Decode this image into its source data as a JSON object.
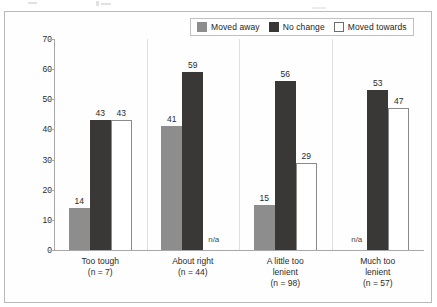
{
  "legend": {
    "items": [
      {
        "label": "Moved away",
        "swatch": "gray-swatch-icon",
        "color": "#8d8d8d"
      },
      {
        "label": "No change",
        "swatch": "dark-swatch-icon",
        "color": "#3a3836"
      },
      {
        "label": "Moved towards",
        "swatch": "white-swatch-icon",
        "color": "#ffffff"
      }
    ]
  },
  "axis": {
    "y_ticks": [
      "0",
      "10",
      "20",
      "30",
      "40",
      "50",
      "60",
      "70"
    ]
  },
  "na_text": "n/a",
  "chart_data": {
    "type": "bar",
    "title": "",
    "xlabel": "",
    "ylabel": "",
    "ylim": [
      0,
      70
    ],
    "ytick_step": 10,
    "grid": false,
    "legend_position": "top-right",
    "categories": [
      "Too tough",
      "About right",
      "A little too lenient",
      "Much too lenient"
    ],
    "category_labels": [
      {
        "name": "Too tough",
        "n": "(n = 7)"
      },
      {
        "name": "About right",
        "n": "(n = 44)"
      },
      {
        "name": "A little too\nlenient",
        "n": "(n = 98)"
      },
      {
        "name": "Much too\nlenient",
        "n": "(n = 57)"
      }
    ],
    "series": [
      {
        "name": "Moved away",
        "values": [
          14,
          41,
          15,
          null
        ]
      },
      {
        "name": "No change",
        "values": [
          43,
          59,
          56,
          53
        ]
      },
      {
        "name": "Moved towards",
        "values": [
          43,
          null,
          29,
          47
        ]
      }
    ],
    "annotations": [
      {
        "category": "About right",
        "series": "Moved towards",
        "text": "n/a"
      },
      {
        "category": "Much too lenient",
        "series": "Moved away",
        "text": "n/a"
      }
    ]
  }
}
